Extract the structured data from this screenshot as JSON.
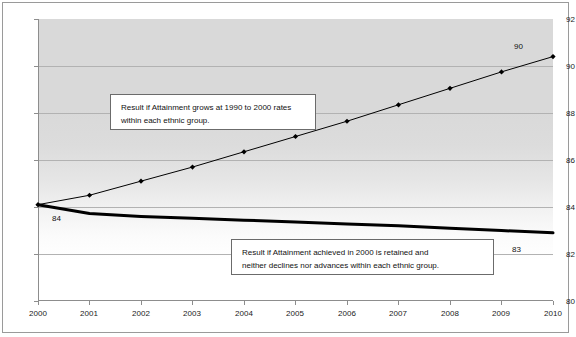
{
  "chart_data": {
    "type": "line",
    "title": "",
    "subtitle": "",
    "xlabel": "",
    "ylabel": "",
    "x": [
      2000,
      2001,
      2002,
      2003,
      2004,
      2005,
      2006,
      2007,
      2008,
      2009,
      2010
    ],
    "xticklabels": [
      "2000",
      "2001",
      "2002",
      "2003",
      "2004",
      "2005",
      "2006",
      "2007",
      "2008",
      "2009",
      "2010"
    ],
    "yticklabels": [
      "80",
      "82",
      "84",
      "86",
      "88",
      "90",
      "92"
    ],
    "yticks": [
      80,
      82,
      84,
      86,
      88,
      90,
      92
    ],
    "ylim": [
      80,
      92
    ],
    "xlim": [
      2000,
      2010
    ],
    "grid": "horizontal",
    "legend": "none",
    "series": [
      {
        "name": "Result if Attainment grows at 1990 to 2000 rates within each ethnic group.",
        "marker": "diamond",
        "color": "#000000",
        "linewidth": 1,
        "values": [
          84.1,
          84.5,
          85.1,
          85.7,
          86.35,
          87.0,
          87.65,
          88.35,
          89.05,
          89.75,
          90.4
        ]
      },
      {
        "name": "Result if Attainment achieved in 2000 is retained and neither declines nor advances within each ethnic group.",
        "marker": "none",
        "color": "#000000",
        "linewidth": 3,
        "values": [
          84.1,
          83.72,
          83.6,
          83.52,
          83.44,
          83.36,
          83.28,
          83.2,
          83.1,
          83.0,
          82.9
        ]
      }
    ],
    "data_labels": [
      {
        "id": "start",
        "text": "84",
        "x": 2000,
        "y": 84.1
      },
      {
        "id": "end_upper",
        "text": "90",
        "x": 2010,
        "y": 90.4
      },
      {
        "id": "end_lower",
        "text": "83",
        "x": 2010,
        "y": 82.9
      }
    ],
    "annotations": [
      {
        "id": "growth",
        "line1": "Result if Attainment grows at 1990 to 2000 rates",
        "line2": "within each ethnic group."
      },
      {
        "id": "retained",
        "line1": "Result if Attainment achieved in 2000  is retained and",
        "line2": "neither declines nor advances within each ethnic group."
      }
    ],
    "colors": {
      "plot_background_top": "#d9d9d9",
      "plot_background_bottom": "#ffffff",
      "gridline": "#b2b2b2",
      "axis": "#8d8d8d",
      "frame": "#9a9a9a",
      "series": "#000000",
      "text": "#111111"
    }
  }
}
